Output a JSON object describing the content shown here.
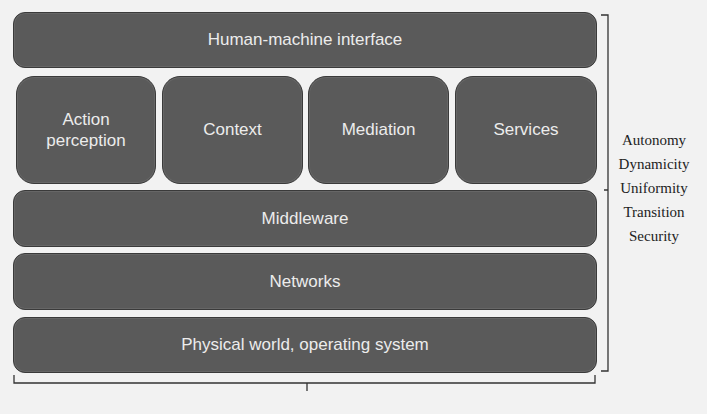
{
  "diagram": {
    "layers": {
      "top": "Human-machine interface",
      "modules": [
        "Action perception",
        "Context",
        "Mediation",
        "Services"
      ],
      "middleware": "Middleware",
      "networks": "Networks",
      "bottom": "Physical world, operating system"
    },
    "side_properties": [
      "Autonomy",
      "Dynamicity",
      "Uniformity",
      "Transition",
      "Security"
    ],
    "colors": {
      "box_fill": "#5a5a5a",
      "box_text": "#ececec",
      "background": "#f2f2f2",
      "line": "#333333"
    }
  }
}
